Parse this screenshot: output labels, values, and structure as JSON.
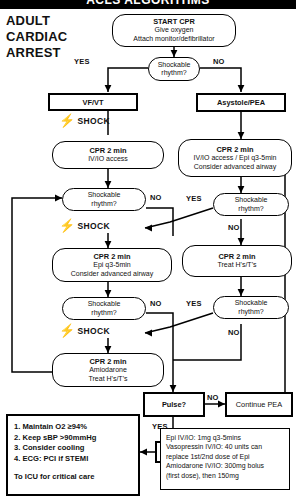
{
  "header": {
    "title": "ACLS ALGORITHMS"
  },
  "page_title": "ADULT\nCARDIAC\nARREST",
  "nodes": {
    "start": {
      "title": "START CPR",
      "line2": "Give oxygen",
      "line3": "Attach monitor/defibrillator"
    },
    "decision1": {
      "line1": "Shockable",
      "line2": "rhythm?"
    },
    "vfvt": {
      "label": "VF/VT"
    },
    "asystole": {
      "label": "Asystole/PEA"
    },
    "cpr_left_1": {
      "title": "CPR 2 min",
      "line2": "IV/IO access"
    },
    "cpr_right_1": {
      "title": "CPR 2 min",
      "line2": "IV/IO access / Epi q3-5min",
      "line3": "Consider advanced airway"
    },
    "decision_left_2": {
      "line1": "Shockable",
      "line2": "rhythm?"
    },
    "decision_right_2": {
      "line1": "Shockable",
      "line2": "rhythm?"
    },
    "cpr_left_2": {
      "title": "CPR 2 min",
      "line2": "Epi q3-5min",
      "line3": "Consider advanced airway"
    },
    "cpr_right_2": {
      "title": "CPR 2 min",
      "line2": "Treat H's/T's"
    },
    "decision_left_3": {
      "line1": "Shockable",
      "line2": "rhythm?"
    },
    "decision_right_3": {
      "line1": "Shockable",
      "line2": "rhythm?"
    },
    "cpr_left_3": {
      "title": "CPR 2 min",
      "line2": "Amiodarone",
      "line3": "Treat H's/T's"
    },
    "pulse": {
      "label": "Pulse?"
    },
    "continue_pea": {
      "label": "Continue PEA"
    },
    "rosc": {
      "label": "ROSC"
    }
  },
  "edge_labels": {
    "yes1": "YES",
    "no1": "NO",
    "no_left_2": "NO",
    "yes_right_2": "YES",
    "no_right_2": "NO",
    "no_left_3": "NO",
    "yes_right_3": "YES",
    "no_right_3": "NO",
    "pulse_no": "NO",
    "pulse_yes": "YES"
  },
  "shock_label": "SHOCK",
  "shock_icon": "lightning-bolt-icon",
  "post_rosc": {
    "items": [
      "1. Maintain O2 ≥94%",
      "2. Keep sBP >90mmHg",
      "3. Consider cooling",
      "4. ECG: PCI if STEMI"
    ],
    "footer": "To ICU for critical care"
  },
  "drug_doses": {
    "lines": [
      "Epi IV/IO: 1mg q3-5mins",
      "Vasopressin IV/IO: 40 units can",
      "replace 1st/2nd dose of Epi",
      "Amiodarone IV/IO: 300mg bolus",
      "(first dose), then 150mg"
    ]
  },
  "colors": {
    "ink": "#000000",
    "paper": "#ffffff"
  }
}
